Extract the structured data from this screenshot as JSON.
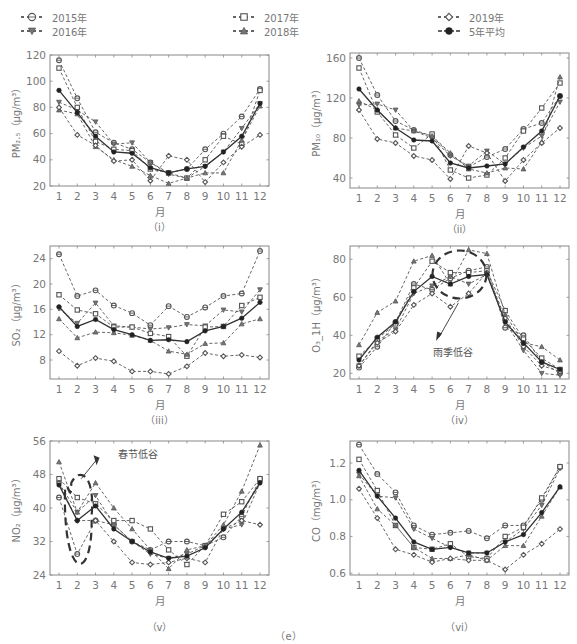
{
  "figure_label": "（e）",
  "legend": [
    {
      "label": "2015年",
      "marker": "circle-dot",
      "x": 20,
      "y": 10
    },
    {
      "label": "2016年",
      "marker": "triangle-down",
      "x": 20,
      "y": 24
    },
    {
      "label": "2017年",
      "marker": "square",
      "x": 232,
      "y": 10
    },
    {
      "label": "2018年",
      "marker": "triangle-up",
      "x": 232,
      "y": 24
    },
    {
      "label": "2019年",
      "marker": "diamond",
      "x": 437,
      "y": 10
    },
    {
      "label": "5年平均",
      "marker": "filled-circle",
      "x": 437,
      "y": 24
    }
  ],
  "chart_data": [
    {
      "type": "line",
      "id": "pm25",
      "sublabel": "（i）",
      "xlabel": "月",
      "ylabel": "PM₂.₅（μg/m³）",
      "categories": [
        1,
        2,
        3,
        4,
        5,
        6,
        7,
        8,
        9,
        10,
        11,
        12
      ],
      "ylim": [
        20,
        120
      ],
      "yticks": [
        20,
        40,
        60,
        80,
        100,
        120
      ],
      "box": {
        "left": 50,
        "top": 55,
        "right": 269,
        "bottom": 186
      },
      "series": [
        {
          "name": "2015年",
          "marker": "circle-dot",
          "values": [
            116,
            87,
            61,
            53,
            48,
            38,
            30,
            33,
            48,
            60,
            73,
            94
          ]
        },
        {
          "name": "2016年",
          "marker": "triangle-down",
          "values": [
            84,
            78,
            69,
            52,
            53,
            38,
            29,
            26,
            35,
            46,
            64,
            83
          ]
        },
        {
          "name": "2017年",
          "marker": "square",
          "values": [
            110,
            80,
            54,
            48,
            47,
            33,
            30,
            26,
            40,
            58,
            52,
            93
          ]
        },
        {
          "name": "2018年",
          "marker": "triangle-up",
          "values": [
            78,
            75,
            50,
            40,
            35,
            28,
            22,
            26,
            30,
            30,
            55,
            81
          ]
        },
        {
          "name": "2019年",
          "marker": "diamond",
          "values": [
            80,
            59,
            51,
            39,
            40,
            24,
            43,
            40,
            23,
            38,
            50,
            59
          ]
        },
        {
          "name": "5年平均",
          "marker": "filled-circle",
          "values": [
            93,
            76,
            58,
            46,
            45,
            34,
            30,
            33,
            35,
            46,
            58,
            83
          ]
        }
      ]
    },
    {
      "type": "line",
      "id": "pm10",
      "sublabel": "（ii）",
      "xlabel": "月",
      "ylabel": "PM₁₀（μg/m³）",
      "categories": [
        1,
        2,
        3,
        4,
        5,
        6,
        7,
        8,
        9,
        10,
        11,
        12
      ],
      "ylim": [
        30,
        165
      ],
      "yticks": [
        40,
        80,
        120,
        160
      ],
      "box": {
        "left": 350,
        "top": 53,
        "right": 569,
        "bottom": 188
      },
      "series": [
        {
          "name": "2015年",
          "marker": "circle-dot",
          "values": [
            160,
            123,
            97,
            88,
            82,
            63,
            51,
            61,
            69,
            89,
            95,
            122
          ]
        },
        {
          "name": "2016年",
          "marker": "triangle-down",
          "values": [
            113,
            114,
            108,
            87,
            80,
            62,
            52,
            67,
            54,
            70,
            82,
            116
          ]
        },
        {
          "name": "2017年",
          "marker": "square",
          "values": [
            150,
            106,
            83,
            70,
            84,
            48,
            40,
            43,
            60,
            87,
            110,
            135
          ]
        },
        {
          "name": "2018年",
          "marker": "triangle-up",
          "values": [
            117,
            108,
            90,
            87,
            82,
            65,
            49,
            45,
            50,
            49,
            76,
            141
          ]
        },
        {
          "name": "2019年",
          "marker": "diamond",
          "values": [
            108,
            79,
            75,
            62,
            58,
            39,
            72,
            65,
            37,
            58,
            75,
            90
          ]
        },
        {
          "name": "5年平均",
          "marker": "filled-circle",
          "values": [
            129,
            108,
            90,
            78,
            77,
            55,
            50,
            52,
            54,
            71,
            87,
            122
          ]
        }
      ]
    },
    {
      "type": "line",
      "id": "so2",
      "sublabel": "（iii）",
      "xlabel": "月",
      "ylabel": "SO₂（μg/m³）",
      "categories": [
        1,
        2,
        3,
        4,
        5,
        6,
        7,
        8,
        9,
        10,
        11,
        12
      ],
      "ylim": [
        5,
        26
      ],
      "yticks": [
        8,
        12,
        16,
        20,
        24
      ],
      "box": {
        "left": 50,
        "top": 246,
        "right": 269,
        "bottom": 379
      },
      "series": [
        {
          "name": "2015年",
          "marker": "circle-dot",
          "values": [
            24.7,
            18.1,
            19.0,
            16.6,
            15.4,
            13.5,
            16.5,
            14.8,
            16.3,
            18.1,
            18.5,
            25.2
          ]
        },
        {
          "name": "2016年",
          "marker": "triangle-down",
          "values": [
            16.1,
            13.8,
            17.0,
            13.4,
            13.2,
            12.9,
            13.1,
            13.6,
            13.4,
            15.9,
            15.6,
            19.1
          ]
        },
        {
          "name": "2017年",
          "marker": "square",
          "values": [
            18.3,
            15.9,
            15.3,
            13.2,
            13.2,
            12.2,
            11.7,
            8.6,
            13.2,
            13.3,
            16.6,
            17.9
          ]
        },
        {
          "name": "2018年",
          "marker": "triangle-up",
          "values": [
            14.5,
            11.5,
            12.4,
            12.3,
            11.9,
            11.1,
            9.4,
            8.9,
            10.6,
            10.7,
            13.7,
            14.5
          ]
        },
        {
          "name": "2019年",
          "marker": "diamond",
          "values": [
            9.4,
            7.1,
            8.3,
            7.8,
            6.2,
            6.2,
            5.8,
            7.0,
            9.1,
            8.6,
            8.8,
            8.4
          ]
        },
        {
          "name": "5年平均",
          "marker": "filled-circle",
          "values": [
            16.4,
            13.3,
            14.4,
            12.8,
            12.0,
            11.1,
            11.2,
            10.9,
            12.6,
            13.3,
            14.6,
            17.1
          ]
        }
      ]
    },
    {
      "type": "line",
      "id": "o3",
      "sublabel": "（iv）",
      "xlabel": "月",
      "ylabel": "O₃_1H（μg/m³）",
      "categories": [
        1,
        2,
        3,
        4,
        5,
        6,
        7,
        8,
        9,
        10,
        11,
        12
      ],
      "ylim": [
        17,
        87
      ],
      "yticks": [
        20,
        40,
        60,
        80
      ],
      "box": {
        "left": 350,
        "top": 246,
        "right": 569,
        "bottom": 379
      },
      "annotation": {
        "text": "雨季低谷",
        "x": 6.5,
        "y": 30
      },
      "series": [
        {
          "name": "2015年",
          "marker": "circle-dot",
          "values": [
            23,
            34,
            47,
            67,
            64,
            70,
            74,
            76,
            44,
            40,
            26,
            20
          ]
        },
        {
          "name": "2016年",
          "marker": "triangle-down",
          "values": [
            24,
            37,
            43,
            62,
            66,
            71,
            67,
            72,
            47,
            32,
            20,
            19
          ]
        },
        {
          "name": "2017年",
          "marker": "square",
          "values": [
            29,
            38,
            46,
            65,
            79,
            73,
            73,
            74,
            53,
            38,
            28,
            22
          ]
        },
        {
          "name": "2018年",
          "marker": "triangle-up",
          "values": [
            35,
            52,
            58,
            79,
            82,
            67,
            85,
            83,
            51,
            36,
            34,
            27
          ]
        },
        {
          "name": "2019年",
          "marker": "diamond",
          "values": [
            24,
            36,
            42,
            56,
            62,
            55,
            62,
            73,
            49,
            34,
            24,
            21
          ]
        },
        {
          "name": "5年平均",
          "marker": "filled-circle",
          "values": [
            27,
            39,
            47,
            63,
            71,
            67,
            71,
            72,
            47,
            36,
            26,
            22
          ]
        }
      ]
    },
    {
      "type": "line",
      "id": "no2",
      "sublabel": "（v）",
      "xlabel": "月",
      "ylabel": "NO₂（μg/m³）",
      "categories": [
        1,
        2,
        3,
        4,
        5,
        6,
        7,
        8,
        9,
        10,
        11,
        12
      ],
      "ylim": [
        24,
        56
      ],
      "yticks": [
        24,
        32,
        40,
        48,
        56
      ],
      "box": {
        "left": 50,
        "top": 441,
        "right": 269,
        "bottom": 575
      },
      "annotation": {
        "text": "春节低谷",
        "x": 4.2,
        "y": 51
      },
      "series": [
        {
          "name": "2015年",
          "marker": "circle-dot",
          "values": [
            42.5,
            29,
            37,
            36,
            32,
            30,
            32,
            32,
            31,
            33,
            38,
            47
          ]
        },
        {
          "name": "2016年",
          "marker": "triangle-down",
          "values": [
            46,
            39,
            43,
            36,
            32,
            29,
            28,
            29,
            31,
            35,
            36,
            46
          ]
        },
        {
          "name": "2017年",
          "marker": "square",
          "values": [
            47,
            42.5,
            41,
            37,
            37,
            35,
            30,
            26.5,
            31,
            38.5,
            41.5,
            47
          ]
        },
        {
          "name": "2018年",
          "marker": "triangle-up",
          "values": [
            51,
            39,
            46,
            40,
            35,
            30,
            25.5,
            30,
            31,
            36,
            44,
            55
          ]
        },
        {
          "name": "2019年",
          "marker": "diamond",
          "values": [
            46,
            37,
            37,
            32,
            27,
            26.5,
            27,
            28,
            27,
            35,
            37,
            36
          ]
        },
        {
          "name": "5年平均",
          "marker": "filled-circle",
          "values": [
            45.5,
            37,
            40.5,
            35,
            32,
            29.5,
            28,
            28.5,
            30.5,
            35,
            39,
            46
          ]
        }
      ]
    },
    {
      "type": "line",
      "id": "co",
      "sublabel": "（vi）",
      "xlabel": "月",
      "ylabel": "CO（mg/m³）",
      "categories": [
        1,
        2,
        3,
        4,
        5,
        6,
        7,
        8,
        9,
        10,
        11,
        12
      ],
      "ylim": [
        0.59,
        1.32
      ],
      "yticks": [
        0.6,
        0.8,
        1.0,
        1.2
      ],
      "box": {
        "left": 350,
        "top": 441,
        "right": 569,
        "bottom": 575
      },
      "series": [
        {
          "name": "2015年",
          "marker": "circle-dot",
          "values": [
            1.3,
            1.14,
            1.04,
            0.86,
            0.81,
            0.82,
            0.83,
            0.79,
            0.86,
            0.86,
            1.0,
            1.18
          ]
        },
        {
          "name": "2016年",
          "marker": "triangle-down",
          "values": [
            1.14,
            1.02,
            1.01,
            0.84,
            0.79,
            0.74,
            0.71,
            0.71,
            0.77,
            0.84,
            0.97,
            1.17
          ]
        },
        {
          "name": "2017年",
          "marker": "square",
          "values": [
            1.22,
            1.05,
            0.86,
            0.74,
            0.73,
            0.76,
            0.69,
            0.68,
            0.8,
            0.85,
            1.01,
            1.18
          ]
        },
        {
          "name": "2018年",
          "marker": "triangle-up",
          "values": [
            1.13,
            0.95,
            0.86,
            0.74,
            0.68,
            0.68,
            0.7,
            0.67,
            0.75,
            0.75,
            0.91,
            1.07
          ]
        },
        {
          "name": "2019年",
          "marker": "diamond",
          "values": [
            1.06,
            0.9,
            0.73,
            0.7,
            0.66,
            0.68,
            0.67,
            0.67,
            0.62,
            0.7,
            0.76,
            0.84
          ]
        },
        {
          "name": "5年平均",
          "marker": "filled-circle",
          "values": [
            1.16,
            1.02,
            0.9,
            0.77,
            0.73,
            0.74,
            0.71,
            0.71,
            0.77,
            0.81,
            0.93,
            1.07
          ]
        }
      ]
    }
  ]
}
